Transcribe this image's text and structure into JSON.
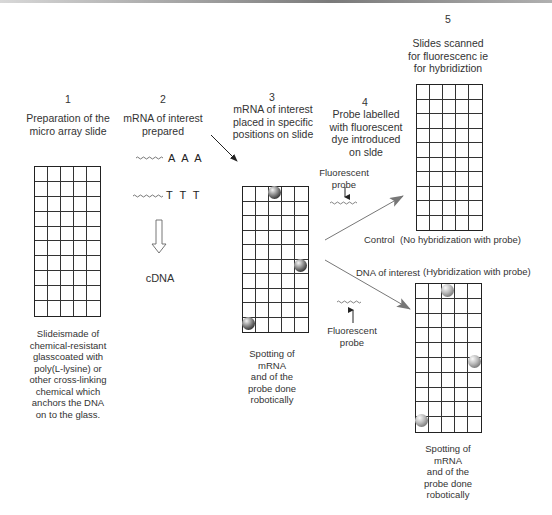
{
  "diagram": {
    "type": "process-flow",
    "steps": [
      {
        "number": "1",
        "title_lines": [
          "Preparation of the",
          "micro array slide"
        ],
        "caption_lines": [
          "Slideismade of",
          "chemical-resistant",
          "glasscoated with",
          "poly(L-lysine) or",
          "other cross-linking",
          "chemical which",
          "anchors the DNA",
          "on to the glass."
        ]
      },
      {
        "number": "2",
        "title_lines": [
          "mRNA of interest",
          "prepared"
        ],
        "sequences": [
          "A A A",
          "T T T"
        ],
        "product": "cDNA"
      },
      {
        "number": "3",
        "title_lines": [
          "mRNA of interest",
          "placed in specific",
          "positions on slide"
        ],
        "caption_lines": [
          "Spotting of",
          "mRNA",
          "and of the",
          "probe done",
          "robotically"
        ]
      },
      {
        "number": "4",
        "title_lines": [
          "Probe labelled",
          "with fluorescent",
          "dye introduced",
          "on slde"
        ],
        "probe_label_top": [
          "Fluorescent",
          "probe"
        ],
        "probe_label_bottom": [
          "Fluorescent",
          "probe"
        ]
      },
      {
        "number": "5",
        "title_lines": [
          "Slides scanned",
          "for fluorescenc ie",
          "for hybridiztion"
        ]
      }
    ],
    "branches": {
      "control": {
        "label": "Control",
        "result": "(No hybridization with probe)"
      },
      "interest": {
        "label": "DNA of interest",
        "result": "(Hybridization with probe)",
        "caption_lines": [
          "Spotting of",
          "mRNA",
          "and of the",
          "probe done",
          "robotically"
        ]
      }
    },
    "grid": {
      "columns": 5,
      "rows": 10
    },
    "spots": {
      "slide_3": [
        {
          "col": 3,
          "row": 1
        },
        {
          "col": 5,
          "row": 6
        },
        {
          "col": 1,
          "row": 10
        }
      ],
      "slide_hybridized": [
        {
          "col": 3,
          "row": 1
        },
        {
          "col": 5,
          "row": 6
        },
        {
          "col": 1,
          "row": 10
        }
      ]
    }
  }
}
